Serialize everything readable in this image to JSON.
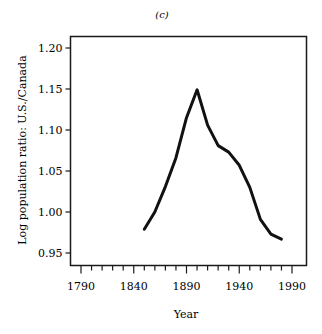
{
  "panel_label": "(c)",
  "chart_data": {
    "type": "line",
    "title": "(c)",
    "xlabel": "Year",
    "ylabel": "Log population ratio: U.S./Canada",
    "xlim": [
      1780,
      1995
    ],
    "ylim": [
      0.95,
      1.22
    ],
    "x_ticks": [
      1790,
      1840,
      1890,
      1940,
      1990
    ],
    "x_tick_labels": [
      "1790",
      "1840",
      "1890",
      "1940",
      "1990"
    ],
    "x_minor_tick_step": 10,
    "y_ticks": [
      0.95,
      1.0,
      1.05,
      1.1,
      1.15,
      1.2
    ],
    "y_tick_labels": [
      "0.95",
      "1.00",
      "1.05",
      "1.10",
      "1.15",
      "1.20"
    ],
    "grid": false,
    "legend": null,
    "series": [
      {
        "name": "U.S./Canada log population ratio",
        "x": [
          1850,
          1860,
          1870,
          1880,
          1890,
          1900,
          1910,
          1920,
          1930,
          1940,
          1950,
          1960,
          1970,
          1980
        ],
        "values": [
          0.979,
          1.0,
          1.031,
          1.066,
          1.115,
          1.149,
          1.106,
          1.081,
          1.073,
          1.057,
          1.03,
          0.991,
          0.973,
          0.967
        ]
      }
    ]
  }
}
